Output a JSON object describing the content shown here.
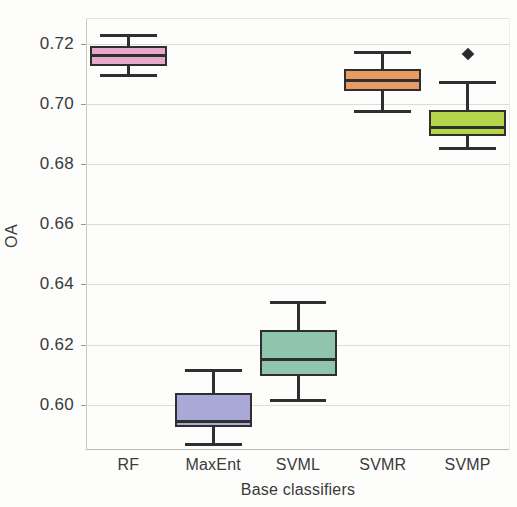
{
  "chart_data": {
    "type": "box",
    "title": "",
    "xlabel": "Base classifiers",
    "ylabel": "OA",
    "categories": [
      "RF",
      "MaxEnt",
      "SVML",
      "SVMR",
      "SVMP"
    ],
    "ylim": [
      0.585,
      0.7285
    ],
    "yticks": [
      0.6,
      0.62,
      0.64,
      0.66,
      0.68,
      0.7,
      0.72
    ],
    "ytick_labels": [
      "0.60",
      "0.62",
      "0.64",
      "0.66",
      "0.68",
      "0.70",
      "0.72"
    ],
    "grid": true,
    "legend": "none",
    "boxes": [
      {
        "name": "RF",
        "color": "#e8a8ca",
        "whisker_low": 0.7094,
        "q1": 0.7127,
        "median": 0.716,
        "q3": 0.7193,
        "whisker_high": 0.7226,
        "outliers": []
      },
      {
        "name": "MaxEnt",
        "color": "#a9a8d6",
        "whisker_low": 0.5868,
        "q1": 0.5926,
        "median": 0.5945,
        "q3": 0.604,
        "whisker_high": 0.6113,
        "outliers": []
      },
      {
        "name": "SVML",
        "color": "#8fc4ad",
        "whisker_low": 0.6013,
        "q1": 0.6097,
        "median": 0.6152,
        "q3": 0.6247,
        "whisker_high": 0.6339,
        "outliers": []
      },
      {
        "name": "SVMR",
        "color": "#e89b62",
        "whisker_low": 0.6973,
        "q1": 0.7043,
        "median": 0.7079,
        "q3": 0.7116,
        "whisker_high": 0.7171,
        "outliers": []
      },
      {
        "name": "SVMP",
        "color": "#b5d64a",
        "whisker_low": 0.6853,
        "q1": 0.6893,
        "median": 0.6922,
        "q3": 0.6981,
        "whisker_high": 0.7072,
        "outliers": [
          0.7167
        ]
      }
    ]
  }
}
